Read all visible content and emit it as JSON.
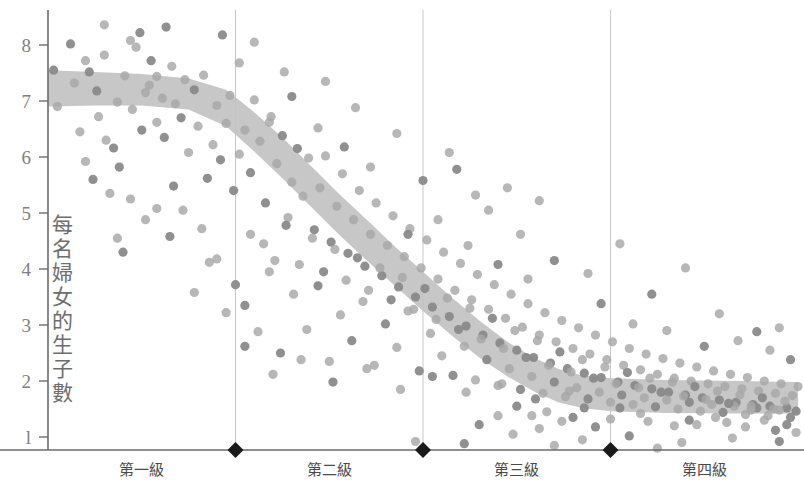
{
  "chart_data": {
    "type": "scatter",
    "title": "",
    "subtitle": "",
    "xlabel": "",
    "ylabel": "每名婦女的生子數",
    "ylim": [
      0.55,
      8.6
    ],
    "yticks": [
      8,
      7,
      6,
      5,
      4,
      3,
      2,
      1
    ],
    "ytick_labels": [
      "8",
      "7",
      "6",
      "5",
      "4",
      "3",
      "2",
      "l"
    ],
    "grid": "vertical-only",
    "legend": "none",
    "xlim": [
      0,
      4
    ],
    "categories": [
      "第一級",
      "第二級",
      "第三級",
      "第四級"
    ],
    "category_boundaries": [
      1,
      2,
      3
    ],
    "boundary_marker": "diamond",
    "colors": {
      "dot": "#a7a7a7",
      "dot_dark": "#8a8a8a",
      "band": "#c2c2c2",
      "axis": "#6b6b6b",
      "gridline": "#c8c8c8",
      "tick_text": "#808080",
      "category_text": "#4a4a4a",
      "marker": "#1a1a1a"
    },
    "band": {
      "name": "trend band",
      "description": "shaded confidence band of fertility trend",
      "upper": [
        [
          0.0,
          7.55
        ],
        [
          0.25,
          7.52
        ],
        [
          0.5,
          7.48
        ],
        [
          0.75,
          7.4
        ],
        [
          0.95,
          7.2
        ],
        [
          1.1,
          6.8
        ],
        [
          1.25,
          6.35
        ],
        [
          1.4,
          5.85
        ],
        [
          1.55,
          5.35
        ],
        [
          1.7,
          4.88
        ],
        [
          1.85,
          4.4
        ],
        [
          2.0,
          3.95
        ],
        [
          2.15,
          3.5
        ],
        [
          2.3,
          3.08
        ],
        [
          2.45,
          2.7
        ],
        [
          2.6,
          2.4
        ],
        [
          2.72,
          2.22
        ],
        [
          2.85,
          2.1
        ],
        [
          3.0,
          2.05
        ],
        [
          3.3,
          2.02
        ],
        [
          3.7,
          2.0
        ],
        [
          4.0,
          1.98
        ]
      ],
      "lower": [
        [
          0.0,
          6.9
        ],
        [
          0.25,
          6.92
        ],
        [
          0.5,
          6.92
        ],
        [
          0.75,
          6.85
        ],
        [
          0.95,
          6.55
        ],
        [
          1.1,
          6.1
        ],
        [
          1.25,
          5.62
        ],
        [
          1.4,
          5.12
        ],
        [
          1.55,
          4.62
        ],
        [
          1.7,
          4.15
        ],
        [
          1.85,
          3.7
        ],
        [
          2.0,
          3.25
        ],
        [
          2.15,
          2.82
        ],
        [
          2.3,
          2.42
        ],
        [
          2.45,
          2.08
        ],
        [
          2.6,
          1.8
        ],
        [
          2.72,
          1.62
        ],
        [
          2.85,
          1.52
        ],
        [
          3.0,
          1.46
        ],
        [
          3.3,
          1.43
        ],
        [
          3.7,
          1.42
        ],
        [
          4.0,
          1.42
        ]
      ]
    },
    "points": [
      [
        0.03,
        7.55
      ],
      [
        0.05,
        6.9
      ],
      [
        0.14,
        7.32
      ],
      [
        0.22,
        7.52
      ],
      [
        0.27,
        6.72
      ],
      [
        0.3,
        8.36
      ],
      [
        0.35,
        6.16
      ],
      [
        0.41,
        7.45
      ],
      [
        0.44,
        8.08
      ],
      [
        0.49,
        8.22
      ],
      [
        0.47,
        7.96
      ],
      [
        0.52,
        7.15
      ],
      [
        0.55,
        7.72
      ],
      [
        0.58,
        6.62
      ],
      [
        0.61,
        7.05
      ],
      [
        0.63,
        8.32
      ],
      [
        0.17,
        6.45
      ],
      [
        0.2,
        5.92
      ],
      [
        0.24,
        5.6
      ],
      [
        0.33,
        5.35
      ],
      [
        0.37,
        4.55
      ],
      [
        0.4,
        4.3
      ],
      [
        0.31,
        6.3
      ],
      [
        0.45,
        6.85
      ],
      [
        0.5,
        6.48
      ],
      [
        0.54,
        7.28
      ],
      [
        0.58,
        7.44
      ],
      [
        0.62,
        6.35
      ],
      [
        0.66,
        7.62
      ],
      [
        0.68,
        6.95
      ],
      [
        0.71,
        6.7
      ],
      [
        0.73,
        7.38
      ],
      [
        0.75,
        6.08
      ],
      [
        0.78,
        7.2
      ],
      [
        0.8,
        6.55
      ],
      [
        0.83,
        7.46
      ],
      [
        0.85,
        5.62
      ],
      [
        0.88,
        6.22
      ],
      [
        0.9,
        6.92
      ],
      [
        0.92,
        5.95
      ],
      [
        0.95,
        6.6
      ],
      [
        0.97,
        7.1
      ],
      [
        0.99,
        5.4
      ],
      [
        1.02,
        6.05
      ],
      [
        1.05,
        6.48
      ],
      [
        1.08,
        5.72
      ],
      [
        1.1,
        7.02
      ],
      [
        1.13,
        6.28
      ],
      [
        1.16,
        5.18
      ],
      [
        1.19,
        6.72
      ],
      [
        1.22,
        5.88
      ],
      [
        1.25,
        6.38
      ],
      [
        1.28,
        4.92
      ],
      [
        1.3,
        5.55
      ],
      [
        1.33,
        6.15
      ],
      [
        1.36,
        5.3
      ],
      [
        1.39,
        5.98
      ],
      [
        1.42,
        4.7
      ],
      [
        1.45,
        5.45
      ],
      [
        1.48,
        6.02
      ],
      [
        1.51,
        4.48
      ],
      [
        1.54,
        5.12
      ],
      [
        1.57,
        5.7
      ],
      [
        1.6,
        4.28
      ],
      [
        1.63,
        4.88
      ],
      [
        1.66,
        5.4
      ],
      [
        1.69,
        4.05
      ],
      [
        1.72,
        4.62
      ],
      [
        1.75,
        5.18
      ],
      [
        1.78,
        3.88
      ],
      [
        1.81,
        4.42
      ],
      [
        1.84,
        4.95
      ],
      [
        1.87,
        3.68
      ],
      [
        1.9,
        4.22
      ],
      [
        1.93,
        4.72
      ],
      [
        1.96,
        3.5
      ],
      [
        1.99,
        4.02
      ],
      [
        2.02,
        4.52
      ],
      [
        2.05,
        3.32
      ],
      [
        2.08,
        3.82
      ],
      [
        2.11,
        4.3
      ],
      [
        2.14,
        3.15
      ],
      [
        2.17,
        3.62
      ],
      [
        2.2,
        4.1
      ],
      [
        2.23,
        2.98
      ],
      [
        2.26,
        3.45
      ],
      [
        2.29,
        3.9
      ],
      [
        2.32,
        2.82
      ],
      [
        2.35,
        3.28
      ],
      [
        2.38,
        3.72
      ],
      [
        2.41,
        2.68
      ],
      [
        2.44,
        3.12
      ],
      [
        2.47,
        3.55
      ],
      [
        2.5,
        2.55
      ],
      [
        2.53,
        2.96
      ],
      [
        2.56,
        3.38
      ],
      [
        2.59,
        2.42
      ],
      [
        2.62,
        2.82
      ],
      [
        2.65,
        3.22
      ],
      [
        2.68,
        2.32
      ],
      [
        2.71,
        2.7
      ],
      [
        2.74,
        3.08
      ],
      [
        2.77,
        2.22
      ],
      [
        2.8,
        2.58
      ],
      [
        2.83,
        2.95
      ],
      [
        2.86,
        2.14
      ],
      [
        2.89,
        2.48
      ],
      [
        2.92,
        2.82
      ],
      [
        2.95,
        2.06
      ],
      [
        2.98,
        2.38
      ],
      [
        3.01,
        2.7
      ],
      [
        3.04,
        1.98
      ],
      [
        3.07,
        2.28
      ],
      [
        3.1,
        2.58
      ],
      [
        3.13,
        1.92
      ],
      [
        3.16,
        2.2
      ],
      [
        3.19,
        2.48
      ],
      [
        3.22,
        1.86
      ],
      [
        3.25,
        2.12
      ],
      [
        3.28,
        2.4
      ],
      [
        3.31,
        1.8
      ],
      [
        3.34,
        2.05
      ],
      [
        3.37,
        2.32
      ],
      [
        3.4,
        1.75
      ],
      [
        3.43,
        2.0
      ],
      [
        3.46,
        2.25
      ],
      [
        3.49,
        1.7
      ],
      [
        3.52,
        1.95
      ],
      [
        3.55,
        2.18
      ],
      [
        3.58,
        1.66
      ],
      [
        3.61,
        1.9
      ],
      [
        3.64,
        2.12
      ],
      [
        3.67,
        1.62
      ],
      [
        3.7,
        1.86
      ],
      [
        3.73,
        2.06
      ],
      [
        3.76,
        1.58
      ],
      [
        3.79,
        1.82
      ],
      [
        3.82,
        2.0
      ],
      [
        3.85,
        1.55
      ],
      [
        3.88,
        1.78
      ],
      [
        3.91,
        1.95
      ],
      [
        3.94,
        1.52
      ],
      [
        3.97,
        1.74
      ],
      [
        4.0,
        1.9
      ],
      [
        1.05,
        3.35
      ],
      [
        1.12,
        2.88
      ],
      [
        1.18,
        3.95
      ],
      [
        1.24,
        2.5
      ],
      [
        1.31,
        3.55
      ],
      [
        1.38,
        2.92
      ],
      [
        1.44,
        3.7
      ],
      [
        1.5,
        2.35
      ],
      [
        1.56,
        3.18
      ],
      [
        1.62,
        2.72
      ],
      [
        1.68,
        3.42
      ],
      [
        1.74,
        2.28
      ],
      [
        1.8,
        3.02
      ],
      [
        1.86,
        2.6
      ],
      [
        1.92,
        3.25
      ],
      [
        1.98,
        2.18
      ],
      [
        2.04,
        2.85
      ],
      [
        2.1,
        2.45
      ],
      [
        2.16,
        2.1
      ],
      [
        2.22,
        2.62
      ],
      [
        2.28,
        2.02
      ],
      [
        2.34,
        2.38
      ],
      [
        2.4,
        1.92
      ],
      [
        2.46,
        2.22
      ],
      [
        2.52,
        1.85
      ],
      [
        2.58,
        2.08
      ],
      [
        2.64,
        1.78
      ],
      [
        2.7,
        1.98
      ],
      [
        2.76,
        1.72
      ],
      [
        2.82,
        1.88
      ],
      [
        2.88,
        1.68
      ],
      [
        2.94,
        1.8
      ],
      [
        3.0,
        1.62
      ],
      [
        3.06,
        1.75
      ],
      [
        3.12,
        1.58
      ],
      [
        3.18,
        1.7
      ],
      [
        3.24,
        1.54
      ],
      [
        3.3,
        1.66
      ],
      [
        3.36,
        1.5
      ],
      [
        3.42,
        1.62
      ],
      [
        3.48,
        1.46
      ],
      [
        3.54,
        1.58
      ],
      [
        3.6,
        1.44
      ],
      [
        3.66,
        1.55
      ],
      [
        3.72,
        1.4
      ],
      [
        3.78,
        1.52
      ],
      [
        3.84,
        1.38
      ],
      [
        3.9,
        1.48
      ],
      [
        3.96,
        1.35
      ],
      [
        1.15,
        4.45
      ],
      [
        1.21,
        4.15
      ],
      [
        1.27,
        4.78
      ],
      [
        1.34,
        4.08
      ],
      [
        1.41,
        4.55
      ],
      [
        1.47,
        3.95
      ],
      [
        1.53,
        4.35
      ],
      [
        1.59,
        3.8
      ],
      [
        1.65,
        4.2
      ],
      [
        1.71,
        3.62
      ],
      [
        1.77,
        4.02
      ],
      [
        1.83,
        3.45
      ],
      [
        1.89,
        3.85
      ],
      [
        1.95,
        3.28
      ],
      [
        2.01,
        3.65
      ],
      [
        2.07,
        3.1
      ],
      [
        2.13,
        3.48
      ],
      [
        2.19,
        2.92
      ],
      [
        2.25,
        3.3
      ],
      [
        2.31,
        2.75
      ],
      [
        2.37,
        3.12
      ],
      [
        2.43,
        2.58
      ],
      [
        2.49,
        2.9
      ],
      [
        2.55,
        2.42
      ],
      [
        2.61,
        2.72
      ],
      [
        2.67,
        2.28
      ],
      [
        2.73,
        2.52
      ],
      [
        2.79,
        2.16
      ],
      [
        2.85,
        2.38
      ],
      [
        2.91,
        2.05
      ],
      [
        2.97,
        2.25
      ],
      [
        3.03,
        1.95
      ],
      [
        3.09,
        2.15
      ],
      [
        3.15,
        1.88
      ],
      [
        3.21,
        2.05
      ],
      [
        3.27,
        1.8
      ],
      [
        3.33,
        1.98
      ],
      [
        3.39,
        1.73
      ],
      [
        3.45,
        1.9
      ],
      [
        3.51,
        1.67
      ],
      [
        3.57,
        1.82
      ],
      [
        3.63,
        1.6
      ],
      [
        3.69,
        1.75
      ],
      [
        3.75,
        1.55
      ],
      [
        3.81,
        1.7
      ],
      [
        3.87,
        1.5
      ],
      [
        3.93,
        1.64
      ],
      [
        3.99,
        1.46
      ],
      [
        1.2,
        2.12
      ],
      [
        1.35,
        2.38
      ],
      [
        1.52,
        1.98
      ],
      [
        1.7,
        2.22
      ],
      [
        1.88,
        1.85
      ],
      [
        2.05,
        2.08
      ],
      [
        2.23,
        1.8
      ],
      [
        2.42,
        1.95
      ],
      [
        2.6,
        1.68
      ],
      [
        2.78,
        1.82
      ],
      [
        0.9,
        4.18
      ],
      [
        1.0,
        3.72
      ],
      [
        1.08,
        4.62
      ],
      [
        0.95,
        3.22
      ],
      [
        1.05,
        2.62
      ],
      [
        0.72,
        5.05
      ],
      [
        0.82,
        4.72
      ],
      [
        0.67,
        5.48
      ],
      [
        0.86,
        4.12
      ],
      [
        0.78,
        3.58
      ],
      [
        2.18,
        5.78
      ],
      [
        2.35,
        5.05
      ],
      [
        2.52,
        4.62
      ],
      [
        2.7,
        4.15
      ],
      [
        2.88,
        3.92
      ],
      [
        3.05,
        4.45
      ],
      [
        3.22,
        3.55
      ],
      [
        3.4,
        4.02
      ],
      [
        3.58,
        3.2
      ],
      [
        3.78,
        2.88
      ],
      [
        2.45,
        5.45
      ],
      [
        2.62,
        5.22
      ],
      [
        2.95,
        3.38
      ],
      [
        3.12,
        3.02
      ],
      [
        3.3,
        2.9
      ],
      [
        3.5,
        2.62
      ],
      [
        3.68,
        2.72
      ],
      [
        3.85,
        2.55
      ],
      [
        3.96,
        2.38
      ],
      [
        3.9,
        2.95
      ],
      [
        1.44,
        6.52
      ],
      [
        1.58,
        6.18
      ],
      [
        1.72,
        5.82
      ],
      [
        1.86,
        6.42
      ],
      [
        2.0,
        5.58
      ],
      [
        2.14,
        6.08
      ],
      [
        2.28,
        5.32
      ],
      [
        1.3,
        7.08
      ],
      [
        1.48,
        7.35
      ],
      [
        1.64,
        6.88
      ],
      [
        1.92,
        4.62
      ],
      [
        2.08,
        4.88
      ],
      [
        2.24,
        4.42
      ],
      [
        2.4,
        4.08
      ],
      [
        2.56,
        3.82
      ],
      [
        0.58,
        5.08
      ],
      [
        0.65,
        4.58
      ],
      [
        0.52,
        4.88
      ],
      [
        0.44,
        5.25
      ],
      [
        0.38,
        5.82
      ],
      [
        1.1,
        8.05
      ],
      [
        1.02,
        7.68
      ],
      [
        0.93,
        8.18
      ],
      [
        1.26,
        7.52
      ],
      [
        1.18,
        6.62
      ],
      [
        2.8,
        1.35
      ],
      [
        3.0,
        1.32
      ],
      [
        3.2,
        1.28
      ],
      [
        3.42,
        1.3
      ],
      [
        3.62,
        1.26
      ],
      [
        3.82,
        1.3
      ],
      [
        2.92,
        1.18
      ],
      [
        3.34,
        1.2
      ],
      [
        3.72,
        1.18
      ],
      [
        3.94,
        1.22
      ],
      [
        2.66,
        1.45
      ],
      [
        2.74,
        1.28
      ],
      [
        2.86,
        1.52
      ],
      [
        3.16,
        1.42
      ],
      [
        3.56,
        1.35
      ],
      [
        2.5,
        1.55
      ],
      [
        2.58,
        1.38
      ],
      [
        3.46,
        1.22
      ],
      [
        3.88,
        1.12
      ],
      [
        3.99,
        1.08
      ],
      [
        1.96,
        0.92
      ],
      [
        2.22,
        0.88
      ],
      [
        2.48,
        1.05
      ],
      [
        2.85,
        0.95
      ],
      [
        3.1,
        1.02
      ],
      [
        3.38,
        0.9
      ],
      [
        3.65,
        0.98
      ],
      [
        3.9,
        0.92
      ],
      [
        2.7,
        0.85
      ],
      [
        3.25,
        0.8
      ],
      [
        2.3,
        1.22
      ],
      [
        2.4,
        1.38
      ],
      [
        2.62,
        1.15
      ],
      [
        3.05,
        1.52
      ],
      [
        3.75,
        1.48
      ],
      [
        0.3,
        7.82
      ],
      [
        0.26,
        7.18
      ],
      [
        0.37,
        6.98
      ],
      [
        0.2,
        7.72
      ],
      [
        0.12,
        8.02
      ]
    ]
  }
}
